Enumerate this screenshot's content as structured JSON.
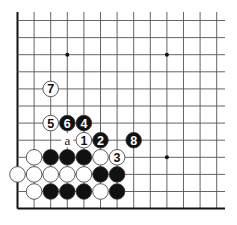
{
  "diagram": {
    "type": "go-board-fragment",
    "grid": {
      "columns": 13,
      "rows": 12,
      "origin_x": 17.5,
      "origin_y": 20.5,
      "spacing_x": 16.6,
      "spacing_y": 17.1,
      "left_edge": true,
      "bottom_edge": true,
      "line_color": "#555555",
      "edge_color": "#111111"
    },
    "star_points": [
      {
        "c": 3,
        "r": 2
      },
      {
        "c": 9,
        "r": 2
      },
      {
        "c": 9,
        "r": 8
      }
    ],
    "stones": [
      {
        "c": 2,
        "r": 4,
        "color": "white",
        "label": "7"
      },
      {
        "c": 2,
        "r": 6,
        "color": "white",
        "label": "5"
      },
      {
        "c": 3,
        "r": 6,
        "color": "black",
        "label": "6"
      },
      {
        "c": 4,
        "r": 6,
        "color": "black",
        "label": "4"
      },
      {
        "c": 4,
        "r": 7,
        "color": "white",
        "label": "1"
      },
      {
        "c": 5,
        "r": 7,
        "color": "black",
        "label": "2"
      },
      {
        "c": 7,
        "r": 7,
        "color": "black",
        "label": "8"
      },
      {
        "c": 1,
        "r": 8,
        "color": "white",
        "label": ""
      },
      {
        "c": 2,
        "r": 8,
        "color": "black",
        "label": ""
      },
      {
        "c": 3,
        "r": 8,
        "color": "black",
        "label": ""
      },
      {
        "c": 4,
        "r": 8,
        "color": "black",
        "label": ""
      },
      {
        "c": 5,
        "r": 8,
        "color": "white",
        "label": ""
      },
      {
        "c": 6,
        "r": 8,
        "color": "white",
        "label": "3"
      },
      {
        "c": 0,
        "r": 9,
        "color": "white",
        "label": ""
      },
      {
        "c": 1,
        "r": 9,
        "color": "white",
        "label": ""
      },
      {
        "c": 2,
        "r": 9,
        "color": "white",
        "label": ""
      },
      {
        "c": 3,
        "r": 9,
        "color": "white",
        "label": ""
      },
      {
        "c": 4,
        "r": 9,
        "color": "white",
        "label": ""
      },
      {
        "c": 5,
        "r": 9,
        "color": "black",
        "label": ""
      },
      {
        "c": 6,
        "r": 9,
        "color": "black",
        "label": ""
      },
      {
        "c": 1,
        "r": 10,
        "color": "white",
        "label": ""
      },
      {
        "c": 2,
        "r": 10,
        "color": "black",
        "label": ""
      },
      {
        "c": 3,
        "r": 10,
        "color": "black",
        "label": ""
      },
      {
        "c": 4,
        "r": 10,
        "color": "black",
        "label": ""
      },
      {
        "c": 5,
        "r": 10,
        "color": "white",
        "label": ""
      },
      {
        "c": 6,
        "r": 10,
        "color": "black",
        "label": ""
      }
    ],
    "point_labels": [
      {
        "c": 3,
        "r": 7,
        "text": "a"
      }
    ],
    "colors": {
      "black_stone": "#111111",
      "white_stone": "#ffffff",
      "stone_outline": "#333333",
      "background": "#ffffff"
    }
  }
}
